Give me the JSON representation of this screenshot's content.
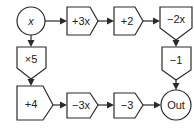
{
  "diagram": {
    "type": "function-machine-flowchart",
    "colors": {
      "stroke": "#2a2a2a",
      "fill": "#ffffff",
      "text": "#222222"
    },
    "nodes": [
      {
        "id": "input",
        "shape": "circle",
        "label": "x"
      },
      {
        "id": "add-3x",
        "shape": "pentagon-right",
        "label": "+3x"
      },
      {
        "id": "add-2",
        "shape": "pentagon-right",
        "label": "+2"
      },
      {
        "id": "sub-2x",
        "shape": "pentagon-down",
        "label": "−2x"
      },
      {
        "id": "sub-1",
        "shape": "pentagon-down",
        "label": "−1"
      },
      {
        "id": "mul-5",
        "shape": "pentagon-down",
        "label": "×5"
      },
      {
        "id": "add-4",
        "shape": "pentagon-right",
        "label": "+4"
      },
      {
        "id": "sub-3x",
        "shape": "pentagon-right",
        "label": "−3x"
      },
      {
        "id": "sub-3",
        "shape": "pentagon-right",
        "label": "−3"
      },
      {
        "id": "output",
        "shape": "circle",
        "label": "Out"
      }
    ],
    "edges": [
      [
        "input",
        "add-3x"
      ],
      [
        "add-3x",
        "add-2"
      ],
      [
        "add-2",
        "sub-2x"
      ],
      [
        "sub-2x",
        "sub-1"
      ],
      [
        "sub-1",
        "output"
      ],
      [
        "input",
        "mul-5"
      ],
      [
        "mul-5",
        "add-4"
      ],
      [
        "add-4",
        "sub-3x"
      ],
      [
        "sub-3x",
        "sub-3"
      ],
      [
        "sub-3",
        "output"
      ]
    ]
  }
}
